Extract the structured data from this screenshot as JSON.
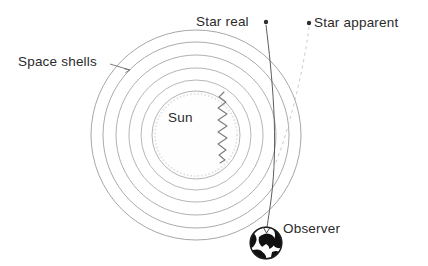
{
  "figure": {
    "background_color": "#ffffff",
    "width": 428,
    "height": 266
  },
  "labels": {
    "space_shells": "Space shells",
    "star_real": "Star real",
    "star_apparent": "Star apparent",
    "sun": "Sun",
    "observer": "Observer"
  },
  "colors": {
    "text": "#2b2b2b",
    "shell_stroke": "#9a9a9a",
    "sun_stroke": "#b0b0b0",
    "sun_fill": "#fdfdfd",
    "ray_solid": "#4a4a4a",
    "ray_dashed": "#c2c2c2",
    "wave": "#7c7c7c",
    "globe_dark": "#111111",
    "globe_light": "#ffffff",
    "pointer": "#6e6e6e"
  },
  "geometry": {
    "center_x": 196,
    "center_y": 135,
    "shell_radii": [
      105,
      93,
      80,
      67,
      55
    ],
    "sun_radius": 44,
    "observer": {
      "x": 266,
      "y": 243,
      "radius": 16
    },
    "star_real_marker": {
      "x": 266,
      "y": 23
    },
    "star_apparent_marker": {
      "x": 309,
      "y": 24
    }
  },
  "elements": {
    "shell_count": 5,
    "real_ray_style": "solid",
    "apparent_ray_style": "dashed",
    "wave_style": "zigzag"
  }
}
